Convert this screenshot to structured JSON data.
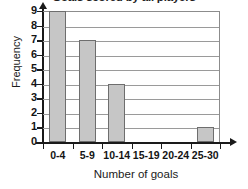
{
  "chart_data": {
    "type": "bar",
    "title": "Goals scored by all players",
    "xlabel": "Number of goals",
    "ylabel": "Frequency",
    "categories": [
      "0-4",
      "5-9",
      "10-14",
      "15-19",
      "20-24",
      "25-30"
    ],
    "values": [
      9,
      7,
      4,
      0,
      0,
      1
    ],
    "ylim": [
      0,
      9
    ],
    "yticks": [
      0,
      1,
      2,
      3,
      4,
      5,
      6,
      7,
      8,
      9
    ],
    "ytick_labels": [
      "0",
      "1",
      "2",
      "3",
      "4",
      "5",
      "6",
      "7",
      "8",
      "9"
    ],
    "grid": true,
    "grid_axis": "y",
    "legend": false,
    "bar_fill": "#c6c6c6",
    "bar_edge": "#6e6e6e",
    "axis_color": "#1a1a1a",
    "grid_color": "#9a9a9a",
    "background": "#ffffff"
  }
}
